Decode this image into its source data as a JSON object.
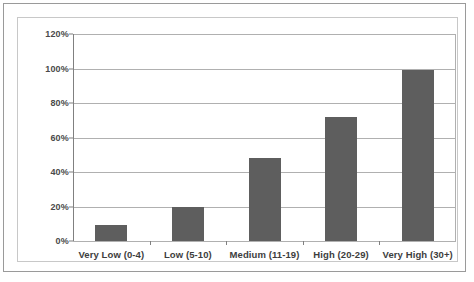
{
  "chart_data": {
    "type": "bar",
    "title": "",
    "xlabel": "",
    "ylabel": "",
    "categories": [
      "Very Low (0-4)",
      "Low (5-10)",
      "Medium (11-19)",
      "High (20-29)",
      "Very High (30+)"
    ],
    "values": [
      9,
      20,
      48,
      72,
      99
    ],
    "ylim": [
      0,
      120
    ],
    "ytick_labels": [
      "0%",
      "20%",
      "40%",
      "60%",
      "80%",
      "100%",
      "120%"
    ],
    "ytick_values": [
      0,
      20,
      40,
      60,
      80,
      100,
      120
    ],
    "grid": true,
    "legend": "none",
    "bar_color": "#5e5e5e",
    "gridline_color": "#b0b0b0",
    "axis_color": "#808080",
    "background_color": "#ffffff",
    "label_color": "#3d3d3d"
  }
}
